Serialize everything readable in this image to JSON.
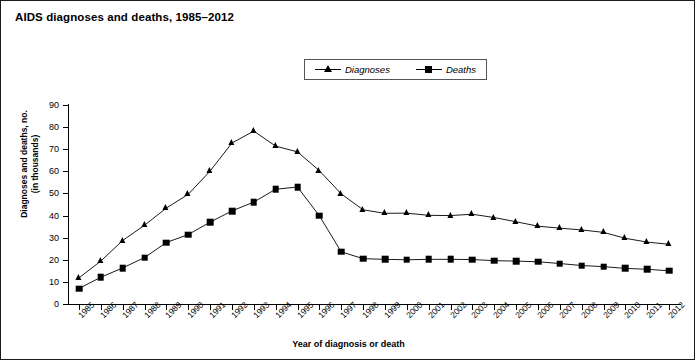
{
  "chart_data": {
    "type": "line",
    "title": "AIDS diagnoses and deaths, 1985–2012",
    "xlabel": "Year of diagnosis or death",
    "ylabel_line1": "Diagnoses and deaths, no.",
    "ylabel_line2": "(in thousands)",
    "ylim": [
      0,
      90
    ],
    "yticks": [
      0,
      10,
      20,
      30,
      40,
      50,
      60,
      70,
      80,
      90
    ],
    "grid": false,
    "legend_position": "top-center",
    "categories": [
      "1985",
      "1986",
      "1987",
      "1988",
      "1989",
      "1990",
      "1991",
      "1992",
      "1993",
      "1994",
      "1995",
      "1996",
      "1997",
      "1998",
      "1999",
      "2000",
      "2001",
      "2002",
      "2003",
      "2004",
      "2005",
      "2006",
      "2007",
      "2008",
      "2009",
      "2010",
      "2011",
      "2012"
    ],
    "series": [
      {
        "name": "Diagnoses",
        "marker": "triangle",
        "color": "#000000",
        "values": [
          11.8,
          19.4,
          28.7,
          35.6,
          43.4,
          49.6,
          60.1,
          72.8,
          78.2,
          71.4,
          68.8,
          60.3,
          49.8,
          42.6,
          41.0,
          41.1,
          40.1,
          40.0,
          40.6,
          39.1,
          37.2,
          35.2,
          34.3,
          33.5,
          32.4,
          29.7,
          28.0,
          27.0
        ]
      },
      {
        "name": "Deaths",
        "marker": "square",
        "color": "#000000",
        "values": [
          7.0,
          12.1,
          16.3,
          21.0,
          27.8,
          31.4,
          37.0,
          42.1,
          46.1,
          51.9,
          52.9,
          39.9,
          23.6,
          20.5,
          20.2,
          20.0,
          20.2,
          20.2,
          20.1,
          19.6,
          19.4,
          19.1,
          18.3,
          17.4,
          16.9,
          16.1,
          15.7,
          15.0
        ]
      }
    ]
  }
}
